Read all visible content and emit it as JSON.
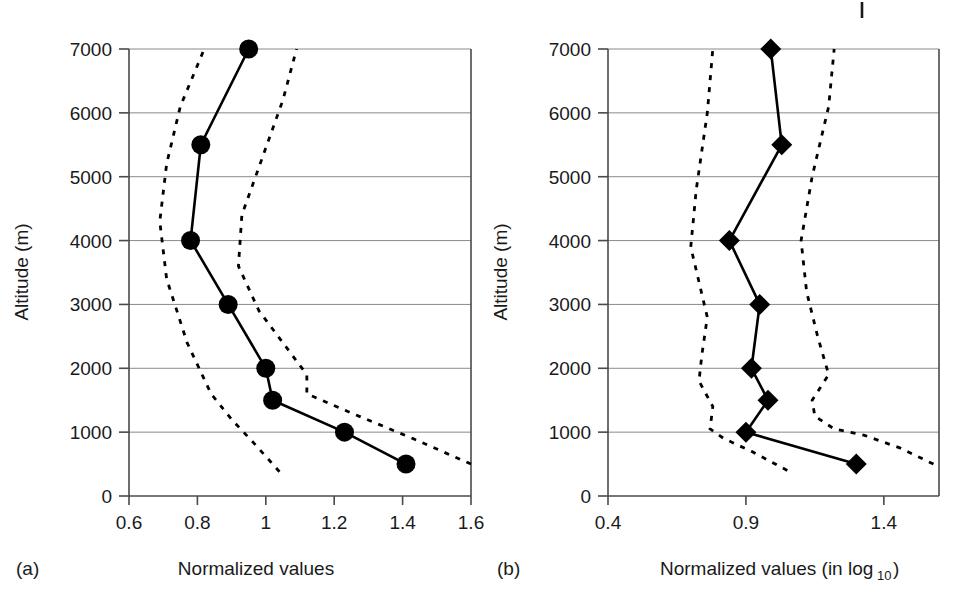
{
  "figure": {
    "background_color": "#ffffff",
    "ink_color": "#000000",
    "grid_color": "#8a8a8a",
    "stray_mark": {
      "present": true,
      "x": 862,
      "y": 2,
      "length": 16
    }
  },
  "chart_data": [
    {
      "type": "line",
      "panel": "a",
      "panel_label": "(a)",
      "title": "",
      "xlabel": "Normalized values",
      "ylabel": "Altitude (m)",
      "xlim": [
        0.6,
        1.6
      ],
      "ylim": [
        0,
        7000
      ],
      "xticks": [
        0.6,
        0.8,
        1.0,
        1.2,
        1.4,
        1.6
      ],
      "xtick_labels": [
        "0.6",
        "0.8",
        "1",
        "1.2",
        "1.4",
        "1.6"
      ],
      "yticks": [
        0,
        1000,
        2000,
        3000,
        4000,
        5000,
        6000,
        7000
      ],
      "ytick_labels": [
        "0",
        "1000",
        "2000",
        "3000",
        "4000",
        "5000",
        "6000",
        "7000"
      ],
      "grid": true,
      "grid_axis": "y",
      "legend": "none",
      "marker": "circle",
      "series": [
        {
          "name": "mean profile",
          "style": "solid",
          "marker": "circle",
          "x": [
            1.41,
            1.23,
            1.02,
            1.0,
            0.89,
            0.78,
            0.81,
            0.95
          ],
          "y": [
            500,
            1000,
            1500,
            2000,
            3000,
            4000,
            5500,
            7000
          ]
        },
        {
          "name": "lower confidence band",
          "style": "dashed",
          "marker": "none",
          "x": [
            1.04,
            0.97,
            0.9,
            0.84,
            0.77,
            0.71,
            0.69,
            0.71,
            0.75,
            0.82
          ],
          "y": [
            380,
            800,
            1200,
            1600,
            2400,
            3400,
            4300,
            5200,
            6100,
            7000
          ]
        },
        {
          "name": "upper confidence band",
          "style": "dashed",
          "marker": "none",
          "x": [
            1.6,
            1.43,
            1.25,
            1.12,
            1.12,
            1.05,
            0.98,
            0.92,
            0.93,
            0.99,
            1.05,
            1.09
          ],
          "y": [
            500,
            900,
            1300,
            1600,
            1900,
            2400,
            2900,
            3600,
            4400,
            5300,
            6200,
            7000
          ]
        }
      ]
    },
    {
      "type": "line",
      "panel": "b",
      "panel_label": "(b)",
      "title": "",
      "xlabel": "Normalized values (in log10)",
      "xlabel_main": "Normalized values (in log",
      "xlabel_sub": "10",
      "xlabel_tail": ")",
      "ylabel": "Altitude (m)",
      "xlim": [
        0.4,
        1.6
      ],
      "ylim": [
        0,
        7000
      ],
      "xticks": [
        0.4,
        0.9,
        1.4
      ],
      "xtick_labels": [
        "0.4",
        "0.9",
        "1.4"
      ],
      "yticks": [
        0,
        1000,
        2000,
        3000,
        4000,
        5000,
        6000,
        7000
      ],
      "ytick_labels": [
        "0",
        "1000",
        "2000",
        "3000",
        "4000",
        "5000",
        "6000",
        "7000"
      ],
      "grid": true,
      "grid_axis": "y",
      "legend": "none",
      "marker": "diamond",
      "series": [
        {
          "name": "mean profile",
          "style": "solid",
          "marker": "diamond",
          "x": [
            1.3,
            0.9,
            0.98,
            0.92,
            0.95,
            0.84,
            1.03,
            0.99
          ],
          "y": [
            500,
            1000,
            1500,
            2000,
            3000,
            4000,
            5500,
            7000
          ]
        },
        {
          "name": "lower confidence band",
          "style": "dashed",
          "marker": "none",
          "x": [
            1.05,
            0.92,
            0.82,
            0.77,
            0.78,
            0.73,
            0.74,
            0.76,
            0.7,
            0.72,
            0.76,
            0.78
          ],
          "y": [
            400,
            700,
            900,
            1050,
            1400,
            1800,
            2200,
            2800,
            3900,
            4800,
            6000,
            7000
          ]
        },
        {
          "name": "upper confidence band",
          "style": "dashed",
          "marker": "none",
          "x": [
            1.58,
            1.46,
            1.33,
            1.22,
            1.15,
            1.14,
            1.2,
            1.16,
            1.12,
            1.1,
            1.14,
            1.2,
            1.22
          ],
          "y": [
            500,
            750,
            950,
            1050,
            1250,
            1500,
            1900,
            2500,
            3200,
            4000,
            5000,
            6100,
            7000
          ]
        }
      ]
    }
  ],
  "panels": {
    "a": {
      "label": "(a)",
      "x_axis_title": "Normalized values",
      "y_axis_title": "Altitude (m)",
      "x_tick_labels": [
        "0.6",
        "0.8",
        "1",
        "1.2",
        "1.4",
        "1.6"
      ],
      "y_tick_labels": [
        "7000",
        "6000",
        "5000",
        "4000",
        "3000",
        "2000",
        "1000",
        "0"
      ]
    },
    "b": {
      "label": "(b)",
      "x_axis_title_main": "Normalized values (in log",
      "x_axis_title_sub": "10",
      "x_axis_title_tail": ")",
      "y_axis_title": "Altitude (m)",
      "x_tick_labels": [
        "0.4",
        "0.9",
        "1.4"
      ],
      "y_tick_labels": [
        "7000",
        "6000",
        "5000",
        "4000",
        "3000",
        "2000",
        "1000",
        "0"
      ]
    }
  }
}
